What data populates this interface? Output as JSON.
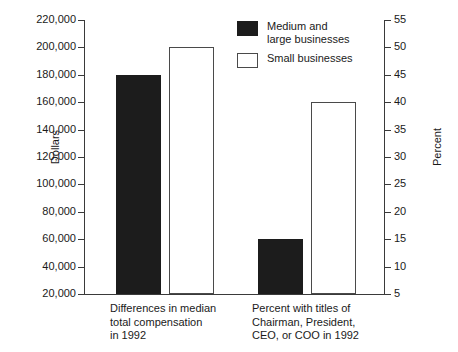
{
  "chart_data": {
    "type": "bar",
    "title": "",
    "subtitle": "",
    "categories": [
      "Differences in median\ntotal compensation\nin 1992",
      "Percent with titles of\nChairman, President,\nCEO, or COO in 1992"
    ],
    "series": [
      {
        "name": "Medium and\nlarge businesses",
        "fill": "#1c1c1c",
        "style": "filled",
        "values": [
          180000,
          15
        ],
        "units": [
          "dollars",
          "percent"
        ]
      },
      {
        "name": "Small businesses",
        "fill": "#ffffff",
        "style": "hollow",
        "values": [
          200000,
          40
        ],
        "units": [
          "dollars",
          "percent"
        ]
      }
    ],
    "xlabel": "",
    "ylabel": "Dollars",
    "ylabel_right": "Percent",
    "ylim": [
      20000,
      220000
    ],
    "ylim_right": [
      5,
      55
    ],
    "yticks": [
      20000,
      40000,
      60000,
      80000,
      100000,
      120000,
      140000,
      160000,
      180000,
      200000,
      220000
    ],
    "ytick_labels": [
      "20,000",
      "40,000",
      "60,000",
      "80,000",
      "100,000",
      "120,000",
      "140,000",
      "160,000",
      "180,000",
      "200,000",
      "220,000"
    ],
    "yticks_right": [
      5,
      10,
      15,
      20,
      25,
      30,
      35,
      40,
      45,
      50,
      55
    ],
    "ytick_labels_right": [
      "5",
      "10",
      "15",
      "20",
      "25",
      "30",
      "35",
      "40",
      "45",
      "50",
      "55"
    ],
    "grid": false,
    "legend_position": "top-center"
  },
  "axes": {
    "left": {
      "title": "Dollars",
      "tick_labels": [
        "220,000",
        "200,000",
        "180,000",
        "160,000",
        "140,000",
        "120,000",
        "100,000",
        "80,000",
        "60,000",
        "40,000",
        "20,000"
      ]
    },
    "right": {
      "title": "Percent",
      "tick_labels": [
        "55",
        "50",
        "45",
        "40",
        "35",
        "30",
        "25",
        "20",
        "15",
        "10",
        "5"
      ]
    }
  },
  "legend": {
    "items": [
      {
        "label": "Medium and\nlarge businesses",
        "style": "filled"
      },
      {
        "label": "Small businesses",
        "style": "hollow"
      }
    ]
  },
  "categories": {
    "group1": "Differences in median\ntotal compensation\nin 1992",
    "group2": "Percent with titles of\nChairman, President,\nCEO, or COO in 1992"
  },
  "colors": {
    "filled_bar": "#1c1c1c",
    "hollow_bar_border": "#4a4a4a",
    "axis": "#3a3a3a",
    "background": "#ffffff",
    "text": "#1a1a1a"
  }
}
